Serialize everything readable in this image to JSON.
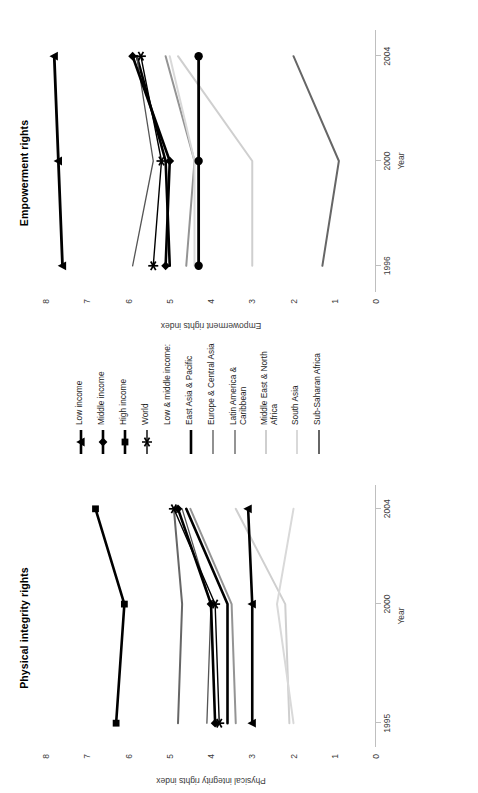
{
  "figure": {
    "panels": [
      {
        "key": "physical",
        "title": "Physical integrity rights",
        "xlabel": "Year",
        "ylabel": "Physical integrity rights index"
      },
      {
        "key": "empowerment",
        "title": "Empowerment rights",
        "xlabel": "Year",
        "ylabel": "Empowerment rights index"
      }
    ]
  },
  "legend": {
    "items": [
      {
        "label": "Low income",
        "marker": "triangle",
        "color": "#000000",
        "width": 2.6
      },
      {
        "label": "Middle income",
        "marker": "diamond",
        "color": "#000000",
        "width": 2.6
      },
      {
        "label": "High income",
        "marker": "square",
        "color": "#000000",
        "width": 2.6
      },
      {
        "label": "World",
        "marker": "star",
        "color": "#000000",
        "width": 1.4
      },
      {
        "label": "Low & middle income:",
        "marker": "none",
        "color": "#ffffff",
        "width": 0
      },
      {
        "label": "East Asia & Pacific",
        "marker": "none",
        "color": "#000000",
        "width": 2.6
      },
      {
        "label": "Europe & Central Asia",
        "marker": "none",
        "color": "#555555",
        "width": 1.3
      },
      {
        "label": "Latin America &\nCaribbean",
        "marker": "none",
        "color": "#949494",
        "width": 2.0
      },
      {
        "label": "Middle East & North\nAfrica",
        "marker": "none",
        "color": "#cfcfcf",
        "width": 2.0
      },
      {
        "label": "South Asia",
        "marker": "none",
        "color": "#d9d9d9",
        "width": 2.0
      },
      {
        "label": "Sub-Saharan Africa",
        "marker": "none",
        "color": "#666666",
        "width": 2.0
      }
    ]
  },
  "chart_data": [
    {
      "type": "line",
      "title": "Physical integrity rights",
      "xlabel": "Year",
      "ylabel": "Physical integrity rights index",
      "x": [
        1995,
        2000,
        2004
      ],
      "xticks": [
        "1995",
        "2000",
        "2004"
      ],
      "xlim": [
        1994,
        2005
      ],
      "ylim": [
        0,
        8
      ],
      "yticks": [
        0,
        1,
        2,
        3,
        4,
        5,
        6,
        7,
        8
      ],
      "grid": false,
      "legend_position": "right",
      "series": [
        {
          "name": "Low income",
          "values": [
            3.0,
            3.0,
            3.1
          ],
          "marker": "triangle",
          "color": "#000000",
          "width": 2.6
        },
        {
          "name": "Middle income",
          "values": [
            3.9,
            4.0,
            4.8
          ],
          "marker": "diamond",
          "color": "#000000",
          "width": 2.6
        },
        {
          "name": "High income",
          "values": [
            6.3,
            6.1,
            6.8
          ],
          "marker": "square",
          "color": "#000000",
          "width": 2.6
        },
        {
          "name": "World",
          "values": [
            3.8,
            3.9,
            4.9
          ],
          "marker": "star",
          "color": "#000000",
          "width": 1.4
        },
        {
          "name": "East Asia & Pacific",
          "values": [
            3.6,
            3.6,
            4.6
          ],
          "marker": "none",
          "color": "#000000",
          "width": 2.6
        },
        {
          "name": "Europe & Central Asia",
          "values": [
            4.1,
            4.0,
            4.7
          ],
          "marker": "none",
          "color": "#555555",
          "width": 1.3
        },
        {
          "name": "Latin America & Caribbean",
          "values": [
            3.4,
            3.5,
            4.5
          ],
          "marker": "none",
          "color": "#949494",
          "width": 2.0
        },
        {
          "name": "Middle East & North Africa",
          "values": [
            2.1,
            2.2,
            3.4
          ],
          "marker": "none",
          "color": "#cfcfcf",
          "width": 2.0
        },
        {
          "name": "South Asia",
          "values": [
            2.0,
            2.4,
            2.0
          ],
          "marker": "none",
          "color": "#d9d9d9",
          "width": 2.0
        },
        {
          "name": "Sub-Saharan Africa",
          "values": [
            4.8,
            4.7,
            4.9
          ],
          "marker": "none",
          "color": "#666666",
          "width": 2.0
        }
      ]
    },
    {
      "type": "line",
      "title": "Empowerment rights",
      "xlabel": "Year",
      "ylabel": "Empowerment rights index",
      "x": [
        1996,
        2000,
        2004
      ],
      "xticks": [
        "1996",
        "2000",
        "2004"
      ],
      "xlim": [
        1995,
        2005
      ],
      "ylim": [
        0,
        8
      ],
      "yticks": [
        0,
        1,
        2,
        3,
        4,
        5,
        6,
        7,
        8
      ],
      "grid": false,
      "legend_position": "right",
      "series": [
        {
          "name": "Low income",
          "values": [
            4.3,
            4.3,
            4.3
          ],
          "marker": "circle",
          "color": "#000000",
          "width": 2.8
        },
        {
          "name": "Middle income",
          "values": [
            5.1,
            5.0,
            5.9
          ],
          "marker": "diamond",
          "color": "#000000",
          "width": 2.6
        },
        {
          "name": "High income",
          "values": [
            7.6,
            7.7,
            7.8
          ],
          "marker": "triangle",
          "color": "#000000",
          "width": 2.8
        },
        {
          "name": "World",
          "values": [
            5.4,
            5.2,
            5.7
          ],
          "marker": "star",
          "color": "#000000",
          "width": 1.4
        },
        {
          "name": "East Asia & Pacific",
          "values": [
            5.0,
            5.1,
            5.8
          ],
          "marker": "none",
          "color": "#000000",
          "width": 2.6
        },
        {
          "name": "Europe & Central Asia",
          "values": [
            5.9,
            5.4,
            5.8
          ],
          "marker": "none",
          "color": "#555555",
          "width": 1.3
        },
        {
          "name": "Latin America & Caribbean",
          "values": [
            4.6,
            4.4,
            5.1
          ],
          "marker": "none",
          "color": "#949494",
          "width": 2.0
        },
        {
          "name": "Middle East & North Africa",
          "values": [
            3.0,
            3.0,
            4.8
          ],
          "marker": "none",
          "color": "#cfcfcf",
          "width": 2.0
        },
        {
          "name": "South Asia",
          "values": [
            4.4,
            4.4,
            5.0
          ],
          "marker": "none",
          "color": "#d9d9d9",
          "width": 2.0
        },
        {
          "name": "Sub-Saharan Africa",
          "values": [
            1.3,
            0.9,
            2.0
          ],
          "marker": "none",
          "color": "#666666",
          "width": 2.0
        }
      ]
    }
  ]
}
